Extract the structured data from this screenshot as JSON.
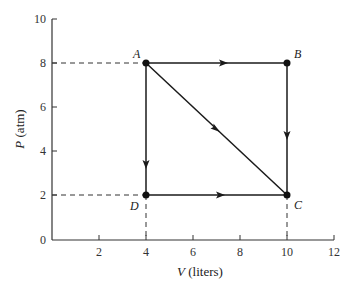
{
  "diagram": {
    "type": "PV cycle diagram",
    "xaxis": {
      "label_var": "V",
      "label_unit": " (liters)",
      "ticks": [
        "2",
        "4",
        "6",
        "8",
        "10",
        "12"
      ],
      "range": [
        0,
        12
      ]
    },
    "yaxis": {
      "label_var": "P",
      "label_unit": " (atm)",
      "ticks": [
        "0",
        "2",
        "4",
        "6",
        "8",
        "10"
      ],
      "range": [
        0,
        10
      ]
    },
    "points": [
      {
        "name": "A",
        "V": 4,
        "P": 8
      },
      {
        "name": "B",
        "V": 10,
        "P": 8
      },
      {
        "name": "C",
        "V": 10,
        "P": 2
      },
      {
        "name": "D",
        "V": 4,
        "P": 2
      }
    ],
    "paths": [
      {
        "from": "A",
        "to": "B"
      },
      {
        "from": "B",
        "to": "C"
      },
      {
        "from": "A",
        "to": "C"
      },
      {
        "from": "A",
        "to": "D"
      },
      {
        "from": "D",
        "to": "C"
      }
    ],
    "colors": {
      "line": "#1a1a1a",
      "axis": "#333333"
    }
  }
}
